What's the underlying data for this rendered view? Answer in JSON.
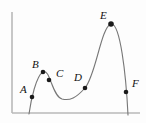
{
  "figure": {
    "background_color": "#fdfdfd",
    "axis_color": "#b9b9b9",
    "curve_color": "#777777",
    "point_color": "#1a1a1a",
    "label_color": "#111111",
    "width": 146,
    "height": 123
  },
  "chart_data": {
    "type": "line",
    "title": "",
    "xlabel": "",
    "ylabel": "",
    "grid": false,
    "legend": null,
    "axes": {
      "x_axis": {
        "x_start": 12,
        "x_end": 140,
        "y": 113
      },
      "y_axis": {
        "x": 12,
        "y_start": 12,
        "y_end": 113
      },
      "arrowheads": false,
      "tick_labels": []
    },
    "curve": {
      "description": "smooth wavy curve with local max at B, local min between C and D, global max at E",
      "path": "M 29,114 C 31,100 36,76 43,72 C 50,68 52,96 62,99 C 70,101 76,98 85,88 C 96,75 101,27 111,24 C 120,22 126,74 128,115",
      "start_point": {
        "x": 29,
        "y": 114
      },
      "end_point": {
        "x": 128,
        "y": 115
      },
      "local_max": {
        "x": 43,
        "y": 72
      },
      "local_min": {
        "x": 68,
        "y": 100
      },
      "global_max": {
        "x": 111,
        "y": 24
      }
    },
    "points": [
      {
        "name": "A",
        "x": 32,
        "y": 97,
        "label_x": 20,
        "label_y": 84,
        "radius": 2.3
      },
      {
        "name": "B",
        "x": 43,
        "y": 72,
        "label_x": 32,
        "label_y": 59,
        "radius": 2.3
      },
      {
        "name": "C",
        "x": 49,
        "y": 80,
        "label_x": 56,
        "label_y": 68,
        "radius": 2.3
      },
      {
        "name": "D",
        "x": 85,
        "y": 88,
        "label_x": 74,
        "label_y": 72,
        "radius": 2.3
      },
      {
        "name": "E",
        "x": 111,
        "y": 24,
        "label_x": 100,
        "label_y": 10,
        "radius": 2.8
      },
      {
        "name": "F",
        "x": 126,
        "y": 92,
        "label_x": 132,
        "label_y": 78,
        "radius": 2.3
      }
    ],
    "point_labels": [
      "A",
      "B",
      "C",
      "D",
      "E",
      "F"
    ]
  }
}
